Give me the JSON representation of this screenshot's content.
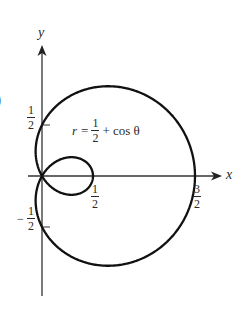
{
  "figure": {
    "part_label_fragment": ")",
    "equation": {
      "lhs": "r",
      "equals": "=",
      "frac_num": "1",
      "frac_den": "2",
      "rest": "+ cos θ"
    },
    "axes": {
      "x_label": "x",
      "y_label": "y"
    },
    "ticks": {
      "y_half": {
        "sign": "",
        "num": "1",
        "den": "2"
      },
      "y_neg_half": {
        "sign": "−",
        "num": "1",
        "den": "2"
      },
      "x_half": {
        "num": "1",
        "den": "2"
      },
      "x_three_half": {
        "num": "3",
        "den": "2"
      }
    },
    "colors": {
      "curve": "#111111",
      "axes": "#333333",
      "text": "#2a2a2a"
    }
  },
  "chart_data": {
    "type": "line",
    "title": "",
    "equation": "r = 1/2 + cos(theta)",
    "xlabel": "x",
    "ylabel": "y",
    "x_ticks": [
      "1/2",
      "3/2"
    ],
    "y_ticks": [
      "1/2",
      "-1/2"
    ],
    "key_points": [
      {
        "theta": "0",
        "x": 1.5,
        "y": 0
      },
      {
        "theta": "pi/2",
        "x": 0,
        "y": 0.5
      },
      {
        "theta": "2pi/3",
        "x": 0,
        "y": 0
      },
      {
        "theta": "pi",
        "x": 0.5,
        "y": 0
      },
      {
        "theta": "4pi/3",
        "x": 0,
        "y": 0
      },
      {
        "theta": "3pi/2",
        "x": 0,
        "y": -0.5
      }
    ],
    "xlim": [
      0,
      1.8
    ],
    "ylim": [
      -1.3,
      1.3
    ],
    "grid": false,
    "legend": "none"
  }
}
